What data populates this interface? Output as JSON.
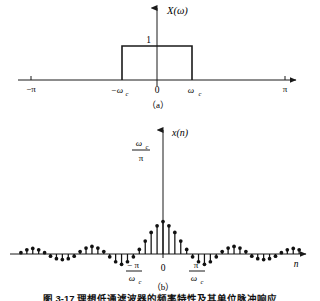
{
  "figure": {
    "panel_a": {
      "name": "ideal-lowpass-spectrum",
      "yaxis_label": "X(ω)",
      "amplitude_label": "1",
      "xtick_left": "−π",
      "xtick_neg_cutoff": "−ω",
      "xtick_neg_cutoff_sub": "c",
      "xtick_origin": "0",
      "xtick_pos_cutoff": "ω",
      "xtick_pos_cutoff_sub": "c",
      "xtick_right": "π",
      "caption": "（a）"
    },
    "panel_b": {
      "name": "sinc-sequence",
      "yaxis_label": "x(n)",
      "peak_numerator": "ω",
      "peak_numerator_sub": "c",
      "peak_denominator": "π",
      "xtick_neg_numerator": "− π",
      "xtick_neg_denominator": "ω",
      "xtick_neg_denominator_sub": "c",
      "xtick_origin": "0",
      "xtick_pos_numerator": "π",
      "xtick_pos_denominator": "ω",
      "xtick_pos_denominator_sub": "c",
      "xaxis_label": "n",
      "caption": "（b）"
    },
    "figure_caption": "图 3-17  理想低通滤波器的频率特性及其单位脉冲响应"
  },
  "colors": {
    "ink": "#1a1a1a",
    "axis": "#333333",
    "stem": "#111111",
    "background": "#ffffff"
  },
  "chart_data": [
    {
      "type": "area",
      "name": "panel-a-rect-spectrum",
      "title": "X(ω)",
      "xlabel": "ω",
      "ylabel": "X(ω)",
      "xlim": [
        -3.14159,
        3.14159
      ],
      "ylim": [
        0,
        1.35
      ],
      "xticks": [
        -3.14159,
        -1.0,
        0,
        1.0,
        3.14159
      ],
      "xticklabels": [
        "−π",
        "−ωc",
        "0",
        "ωc",
        "π"
      ],
      "yticks": [
        1
      ],
      "yticklabels": [
        "1"
      ],
      "grid": false,
      "legend": null,
      "x": [
        -3.14159,
        -1.0,
        -1.0,
        1.0,
        1.0,
        3.14159
      ],
      "values": [
        0,
        0,
        1,
        1,
        0,
        0
      ]
    },
    {
      "type": "line",
      "name": "panel-b-sinc-stems",
      "title": "x(n)",
      "xlabel": "n",
      "ylabel": "x(n)",
      "xlim": [
        -25,
        25
      ],
      "ylim": [
        -0.26,
        1.05
      ],
      "xticks": [
        -4,
        0,
        4
      ],
      "xticklabels": [
        "−π/ωc",
        "0",
        "π/ωc"
      ],
      "yticks": [
        1
      ],
      "yticklabels": [
        "ωc/π"
      ],
      "grid": false,
      "legend": null,
      "x": [
        -24,
        -23,
        -22,
        -21,
        -20,
        -19,
        -18,
        -17,
        -16,
        -15,
        -14,
        -13,
        -12,
        -11,
        -10,
        -9,
        -8,
        -7,
        -6,
        -5,
        -4,
        -3,
        -2,
        -1,
        0,
        1,
        2,
        3,
        4,
        5,
        6,
        7,
        8,
        9,
        10,
        11,
        12,
        13,
        14,
        15,
        16,
        17,
        18,
        19,
        20,
        21,
        22,
        23,
        24
      ],
      "values": [
        0.013,
        0.041,
        0.055,
        0.041,
        0.013,
        -0.021,
        -0.046,
        -0.055,
        -0.046,
        -0.021,
        0.024,
        0.058,
        0.074,
        0.058,
        0.024,
        -0.028,
        -0.076,
        -0.101,
        -0.076,
        -0.028,
        0.045,
        0.127,
        0.212,
        0.276,
        0.318,
        0.276,
        0.212,
        0.127,
        0.045,
        -0.028,
        -0.076,
        -0.101,
        -0.076,
        -0.028,
        0.024,
        0.058,
        0.074,
        0.058,
        0.024,
        -0.021,
        -0.046,
        -0.055,
        -0.046,
        -0.021,
        0.013,
        0.041,
        0.055,
        0.041,
        0.013
      ]
    }
  ]
}
